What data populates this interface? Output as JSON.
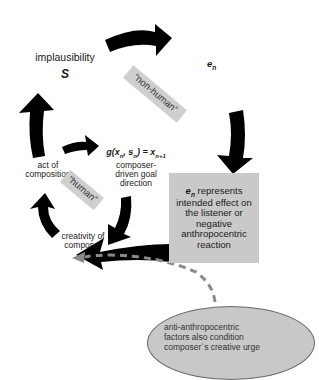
{
  "diagram": {
    "implausibility": {
      "label": "implausibility",
      "symbol": "S"
    },
    "effect_top": {
      "symbol": "e",
      "subscript": "n"
    },
    "tags": {
      "non_human": "“non-human”",
      "human": "“human”"
    },
    "act_of_composition": {
      "line1": "act of",
      "line2": "composition"
    },
    "goal_function": {
      "g": "g(x",
      "sub_n1": "n",
      "comma": ", s",
      "sub_n2": "n",
      "eq": ") = x",
      "sub_n_plus_1": "n+1",
      "desc_line1": "composer-",
      "desc_line2": "driven goal",
      "desc_line3": "direction"
    },
    "creativity": {
      "line1": "creativity of",
      "line2": "composer"
    },
    "effect_box": {
      "symbol": "e",
      "subscript": "n",
      "text_line1": " represents",
      "text_line2": "intended effect on",
      "text_line3": "the listener or",
      "text_line4": "negative",
      "text_line5": "anthropocentric",
      "text_line6": "reaction"
    },
    "ellipse_note": {
      "line1": "anti-anthropocentric",
      "line2": "factors also condition",
      "line3": "composer`s creative urge"
    },
    "colors": {
      "arrow": "#000000",
      "box_fill": "#c9c9c9",
      "tag_fill": "#cfcfcf",
      "dashed_line": "#8a8a8a",
      "ellipse_fill": "#c8c8c8",
      "ellipse_border": "#6a6a6a"
    }
  }
}
